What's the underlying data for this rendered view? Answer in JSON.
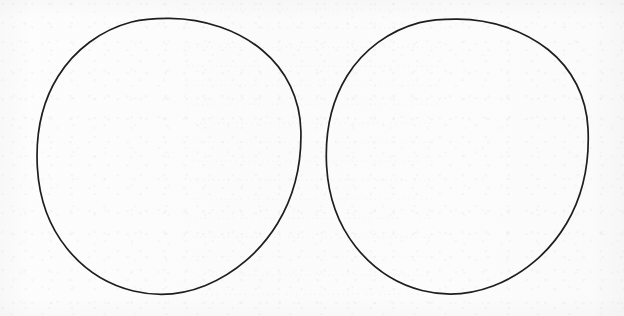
{
  "page": {
    "media": "scanned-paper-sheet",
    "width": 624,
    "height": 316,
    "background_color": "#fcfcfc",
    "ink_color": "#1e1e1e",
    "ghost_text_color": "#7a5f62",
    "visible_text": "",
    "caption": ""
  },
  "shapes": [
    {
      "name": "left-circle",
      "label": "",
      "shape": "circle",
      "stroke_color": "#1e1e1e",
      "stroke_width": 1.7,
      "fill": "none",
      "center_x": 169,
      "center_y": 156,
      "radius_x": 132,
      "radius_y": 138,
      "left": 37,
      "top": 18,
      "right": 301,
      "bottom": 294,
      "contents": ""
    },
    {
      "name": "right-circle",
      "label": "",
      "shape": "circle",
      "stroke_color": "#1e1e1e",
      "stroke_width": 1.7,
      "fill": "none",
      "center_x": 457,
      "center_y": 157,
      "radius_x": 131,
      "radius_y": 138,
      "left": 326,
      "top": 19,
      "right": 588,
      "bottom": 295,
      "contents": ""
    }
  ],
  "showthrough": {
    "legible": false,
    "note": "",
    "lines": [
      {
        "top": 2,
        "text": "· ···· ······ ··· ···· ·· ······· ···· ··· ······ ··· ····"
      },
      {
        "top": 21,
        "text": "···· ·· ······· ···· ····· ·· ······ ····· ··· ······· ···"
      },
      {
        "top": 40,
        "text": "··· ······ ···· ·· ······· ···· ····· ··· ······ ···· ··"
      },
      {
        "top": 59,
        "text": "····· ··· ······· ·· ····· ······ ··· ···· ······ ····"
      },
      {
        "top": 78,
        "text": "·· ······· ···· ··· ······ ····· ···· ·· ······· ·····"
      },
      {
        "top": 97,
        "text": "······ ··· ···· ····· ·· ······· ··· ····· ···· ······"
      },
      {
        "top": 116,
        "text": "··· ····· ······· ··· ···· ······ ·· ····· ···· ···"
      },
      {
        "top": 135,
        "text": "···· ······ ··· ····· ···· ·· ······· ···· ····· ··"
      },
      {
        "top": 154,
        "text": "·· ···· ····· ······ ··· ······· ···· ··· ····· ····"
      },
      {
        "top": 173,
        "text": "····· ······· ·· ···· ······ ··· ····· ···· ······ ··"
      },
      {
        "top": 192,
        "text": "··· ···· ······ ····· ·· ······ ···· ··· ······· ···"
      },
      {
        "top": 211,
        "text": "···· ·· ····· ······ ··· ······· ····· ··· ···· ·····"
      },
      {
        "top": 230,
        "text": "·· ······ ···· ····· ··· ······ ·· ······· ···· ···"
      },
      {
        "top": 249,
        "text": "····· ··· ······· ···· ·· ····· ······ ··· ···· ····"
      },
      {
        "top": 268,
        "text": "··· ······ ····· ·· ···· ······· ··· ····· ···· ··"
      },
      {
        "top": 287,
        "text": "···· ····· ·· ······· ···· ··· ······ ····· ····"
      }
    ]
  }
}
